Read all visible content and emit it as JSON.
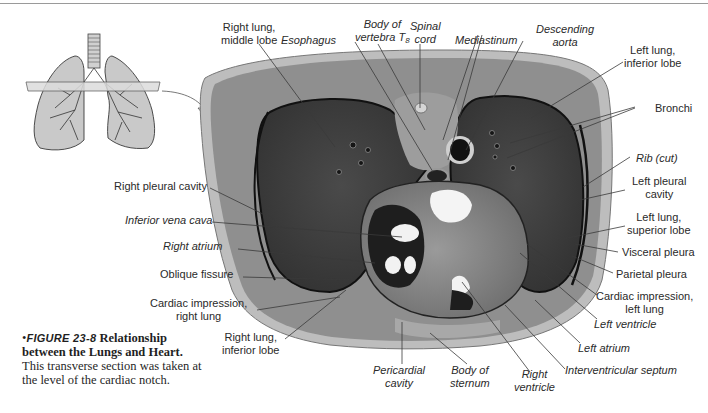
{
  "figure": {
    "number_label": "FIGURE 23-8",
    "bullet": "•",
    "title": "Relationship between the Lungs and Heart.",
    "caption": "This transverse section was taken at the level of the cardiac notch."
  },
  "inset": {
    "description": "lungs-and-trachea-diagram with transverse cutting plane",
    "colors": {
      "lung_fill": "#c9c9c9",
      "outline": "#3a3a3a",
      "plane": "#d8d8d8"
    }
  },
  "section_colors": {
    "body_wall": "#8f8f8f",
    "outer_skin": "#bdbdbd",
    "lung_tissue": "#3f3f3f",
    "heart": "#8a8a8a",
    "cavity_dark": "#1a1a1a",
    "chamber_light": "#f2f2f2"
  },
  "labels": {
    "right_lung_middle": [
      "Right lung,",
      "middle lobe"
    ],
    "esophagus": "Esophagus",
    "vertebra": [
      "Body of",
      "vertebra T"
    ],
    "vertebra_sub": "8",
    "spinal_cord": [
      "Spinal",
      "cord"
    ],
    "mediastinum": "Mediastinum",
    "descending_aorta": [
      "Descending",
      "aorta"
    ],
    "left_lung_inferior": [
      "Left lung,",
      "inferior lobe"
    ],
    "bronchi": "Bronchi",
    "rib": "Rib (cut)",
    "left_pleural_cavity": [
      "Left pleural",
      "cavity"
    ],
    "left_lung_superior": [
      "Left lung,",
      "superior lobe"
    ],
    "visceral_pleura": "Visceral pleura",
    "parietal_pleura": "Parietal pleura",
    "cardiac_impression_left": [
      "Cardiac impression,",
      "left lung"
    ],
    "left_ventricle": "Left ventricle",
    "left_atrium": "Left atrium",
    "interventricular_septum": "Interventricular septum",
    "right_ventricle": [
      "Right",
      "ventricle"
    ],
    "body_of_sternum": [
      "Body of",
      "sternum"
    ],
    "pericardial_cavity": [
      "Pericardial",
      "cavity"
    ],
    "right_lung_inferior": [
      "Right lung,",
      "inferior lobe"
    ],
    "cardiac_impression_right": [
      "Cardiac impression,",
      "right lung"
    ],
    "oblique_fissure": "Oblique fissure",
    "right_atrium": "Right atrium",
    "inferior_vena_cava": "Inferior vena cava",
    "right_pleural_cavity": "Right pleural cavity"
  }
}
